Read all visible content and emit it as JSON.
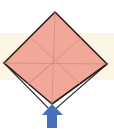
{
  "diagram": {
    "type": "origami-step",
    "colors": {
      "background": "#ffffff",
      "band": "#fdf5e4",
      "paper": "#f2a898",
      "crease": "#c98a7c",
      "outline": "#2b1d1a",
      "flap_outline": "#333333",
      "arrow": "#4a70b8"
    },
    "shapes": {
      "diamond": {
        "top": [
          55,
          12
        ],
        "right": [
          107,
          64
        ],
        "bottom": [
          52,
          104
        ],
        "left": [
          4,
          63
        ]
      },
      "flap_bottom": [
        52,
        112
      ],
      "arrow": {
        "direction": "up",
        "tip": [
          52,
          104
        ],
        "base_y": 128
      }
    }
  }
}
